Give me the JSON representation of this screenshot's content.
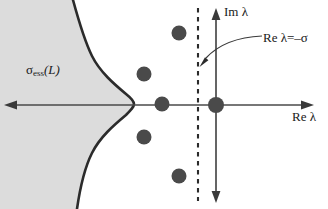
{
  "figure": {
    "name": "spectrum-complex-plane",
    "labels": {
      "im_axis": "Im λ",
      "re_axis": "Re λ",
      "re_sigma_line": "Re λ=–σ",
      "essential_spectrum": "σ",
      "essential_spectrum_sub": "ess",
      "essential_spectrum_arg": "(L)"
    },
    "colors": {
      "shaded_region_fill": "#dcdcdc",
      "boundary_curve": "#2b2b2b",
      "axis": "#444444",
      "dashed_line": "#2b2b2b",
      "eigenvalue_dot": "#4a4a4a",
      "text": "#1a1a1a",
      "background": "#ffffff"
    },
    "geometry": {
      "origin": {
        "x": 216,
        "y": 105
      },
      "real_axis_y": 105,
      "imaginary_axis_x": 216,
      "dashed_line_x": 198,
      "curve_apex": {
        "x": 134,
        "y": 104
      }
    },
    "eigenvalues": [
      {
        "name": "eigenvalue-top",
        "x": 179,
        "y": 33,
        "r": 7.5
      },
      {
        "name": "eigenvalue-upper-left",
        "x": 144,
        "y": 74,
        "r": 7.5
      },
      {
        "name": "eigenvalue-real-left",
        "x": 162,
        "y": 104,
        "r": 7.5
      },
      {
        "name": "eigenvalue-origin",
        "x": 216,
        "y": 105,
        "r": 8.0
      },
      {
        "name": "eigenvalue-lower-left",
        "x": 144,
        "y": 137,
        "r": 7.5
      },
      {
        "name": "eigenvalue-bottom",
        "x": 179,
        "y": 176,
        "r": 7.5
      }
    ]
  }
}
